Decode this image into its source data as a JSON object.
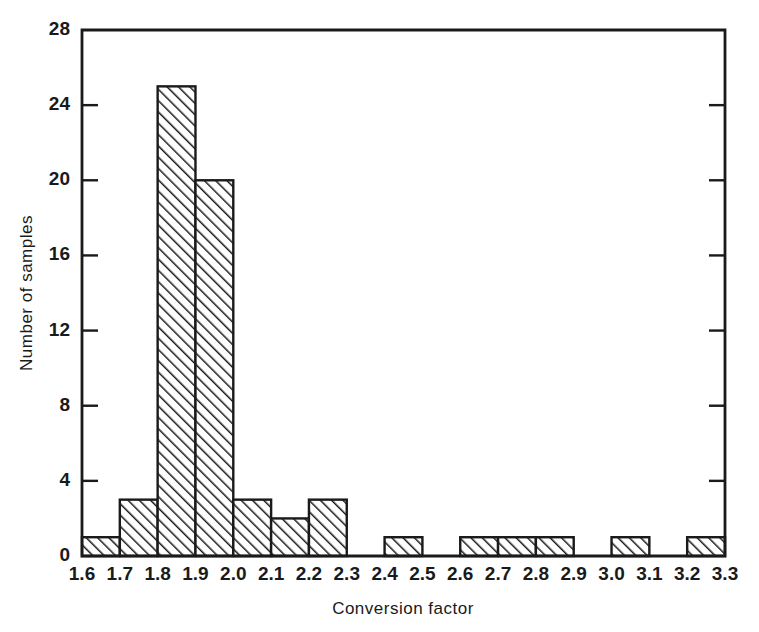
{
  "chart_data": {
    "type": "bar",
    "title": "",
    "subtitle": "",
    "xlabel": "Conversion factor",
    "ylabel": "Number of samples",
    "bin_width": 0.1,
    "bin_edges": [
      1.6,
      1.7,
      1.8,
      1.9,
      2.0,
      2.1,
      2.2,
      2.3,
      2.4,
      2.5,
      2.6,
      2.7,
      2.8,
      2.9,
      3.0,
      3.1,
      3.2,
      3.3
    ],
    "categories": [
      "1.6-1.7",
      "1.7-1.8",
      "1.8-1.9",
      "1.9-2.0",
      "2.0-2.1",
      "2.1-2.2",
      "2.2-2.3",
      "2.3-2.4",
      "2.4-2.5",
      "2.5-2.6",
      "2.6-2.7",
      "2.7-2.8",
      "2.8-2.9",
      "2.9-3.0",
      "3.0-3.1",
      "3.1-3.2",
      "3.2-3.3"
    ],
    "values": [
      1,
      3,
      25,
      20,
      3,
      2,
      3,
      0,
      1,
      0,
      1,
      1,
      1,
      0,
      1,
      0,
      1
    ],
    "xlim": [
      1.6,
      3.3
    ],
    "ylim": [
      0,
      28
    ],
    "xtick_labels": [
      "1.6",
      "1.7",
      "1.8",
      "1.9",
      "2.0",
      "2.1",
      "2.2",
      "2.3",
      "2.4",
      "2.5",
      "2.6",
      "2.7",
      "2.8",
      "2.9",
      "3.0",
      "3.1",
      "3.2",
      "3.3"
    ],
    "xtick_values": [
      1.6,
      1.7,
      1.8,
      1.9,
      2.0,
      2.1,
      2.2,
      2.3,
      2.4,
      2.5,
      2.6,
      2.7,
      2.8,
      2.9,
      3.0,
      3.1,
      3.2,
      3.3
    ],
    "ytick_labels": [
      "0",
      "4",
      "8",
      "12",
      "16",
      "20",
      "24",
      "28"
    ],
    "ytick_values": [
      0,
      4,
      8,
      12,
      16,
      20,
      24,
      28
    ],
    "grid": false,
    "legend": null,
    "bar_fill": "hatched-diagonal",
    "colors": {
      "axis": "#1a1a1a",
      "bar_outline": "#1a1a1a",
      "bar_hatch": "#1a1a1a",
      "background": "#ffffff"
    },
    "total_samples": 45
  },
  "axes": {
    "plot_left_px": 82,
    "plot_right_px": 725,
    "plot_top_px": 30,
    "plot_bottom_px": 556
  }
}
